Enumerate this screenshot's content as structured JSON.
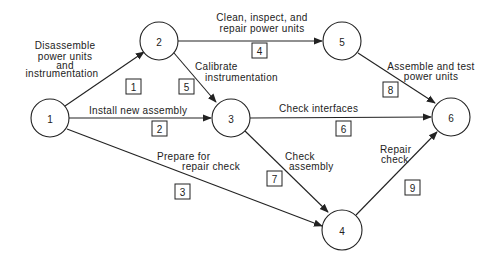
{
  "diagram": {
    "type": "activity-on-arrow network",
    "nodes": [
      {
        "id": "1",
        "label": "1",
        "x": 50,
        "y": 118,
        "r": 19
      },
      {
        "id": "2",
        "label": "2",
        "x": 159,
        "y": 41,
        "r": 19
      },
      {
        "id": "3",
        "label": "3",
        "x": 231,
        "y": 118,
        "r": 19
      },
      {
        "id": "5",
        "label": "5",
        "x": 342,
        "y": 41,
        "r": 19
      },
      {
        "id": "6",
        "label": "6",
        "x": 451,
        "y": 117,
        "r": 19
      },
      {
        "id": "4",
        "label": "4",
        "x": 342,
        "y": 230,
        "r": 20
      }
    ],
    "activities": [
      {
        "num": "1",
        "from": "1",
        "to": "2",
        "label_lines": [
          "Disassemble",
          "power units",
          "and",
          "instrumentation"
        ]
      },
      {
        "num": "2",
        "from": "1",
        "to": "3",
        "label_lines": [
          "Install new assembly"
        ]
      },
      {
        "num": "3",
        "from": "1",
        "to": "4",
        "label_lines": [
          "Prepare for",
          "repair check"
        ]
      },
      {
        "num": "4",
        "from": "2",
        "to": "5",
        "label_lines": [
          "Clean, inspect, and",
          "repair power units"
        ]
      },
      {
        "num": "5",
        "from": "2",
        "to": "3",
        "label_lines": [
          "Calibrate",
          "instrumentation"
        ]
      },
      {
        "num": "6",
        "from": "3",
        "to": "6",
        "label_lines": [
          "Check interfaces"
        ]
      },
      {
        "num": "7",
        "from": "3",
        "to": "4",
        "label_lines": [
          "Check",
          "assembly"
        ]
      },
      {
        "num": "8",
        "from": "5",
        "to": "6",
        "label_lines": [
          "Assemble and test",
          "power units"
        ]
      },
      {
        "num": "9",
        "from": "4",
        "to": "6",
        "label_lines": [
          "Repair",
          "check"
        ]
      }
    ]
  },
  "nodes": {
    "n1": "1",
    "n2": "2",
    "n3": "3",
    "n4": "4",
    "n5": "5",
    "n6": "6"
  },
  "boxes": {
    "b1": "1",
    "b2": "2",
    "b3": "3",
    "b4": "4",
    "b5": "5",
    "b6": "6",
    "b7": "7",
    "b8": "8",
    "b9": "9"
  },
  "labels": {
    "a1": [
      "Disassemble",
      "power units",
      "and",
      "instrumentation"
    ],
    "a2": "Install new assembly",
    "a3": [
      "Prepare for",
      "repair check"
    ],
    "a4": [
      "Clean, inspect, and",
      "repair power units"
    ],
    "a5": [
      "Calibrate",
      "instrumentation"
    ],
    "a6": "Check interfaces",
    "a7": [
      "Check",
      "assembly"
    ],
    "a8": [
      "Assemble and test",
      "power units"
    ],
    "a9": [
      "Repair",
      "check"
    ]
  },
  "colors": {
    "stroke": "#222222",
    "background": "#ffffff"
  }
}
